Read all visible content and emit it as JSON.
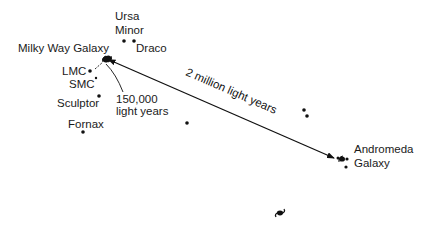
{
  "diagram": {
    "type": "local-group-map",
    "labels": {
      "milky_way": "Milky Way Galaxy",
      "ursa_minor_line1": "Ursa",
      "ursa_minor_line2": "Minor",
      "draco": "Draco",
      "lmc": "LMC",
      "smc": "SMC",
      "sculptor": "Sculptor",
      "fornax": "Fornax",
      "distance_small_line1": "150,000",
      "distance_small_line2": "light years",
      "distance_large": "2 million light years",
      "andromeda_line1": "Andromeda",
      "andromeda_line2": "Galaxy"
    },
    "ink_color": "#111111"
  }
}
